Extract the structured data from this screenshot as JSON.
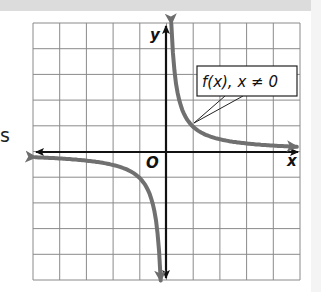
{
  "page": {
    "stray_text": "s"
  },
  "chart_data": {
    "type": "line",
    "title": "",
    "function_label": "f(x), x ≠ 0",
    "xlabel": "x",
    "ylabel": "y",
    "origin_label": "O",
    "grid": true,
    "grid_columns": 10,
    "grid_rows": 10,
    "xlim": [
      -5,
      5
    ],
    "ylim": [
      -5,
      5
    ],
    "series": [
      {
        "name": "f(x), x ≠ 0",
        "branch": "positive",
        "x": [
          0.15,
          0.25,
          0.5,
          1,
          2,
          3,
          4,
          4.9
        ],
        "y": [
          5,
          4,
          2,
          1,
          0.5,
          0.33,
          0.25,
          0.2
        ]
      },
      {
        "name": "f(x), x ≠ 0",
        "branch": "negative",
        "x": [
          -4.9,
          -4,
          -3,
          -2,
          -1,
          -0.5,
          -0.25,
          -0.15
        ],
        "y": [
          -0.2,
          -0.25,
          -0.33,
          -0.5,
          -1,
          -2,
          -4,
          -5
        ]
      }
    ],
    "colors": {
      "curve": "#707070",
      "axes": "#111111",
      "grid": "#8a8a8a"
    }
  }
}
